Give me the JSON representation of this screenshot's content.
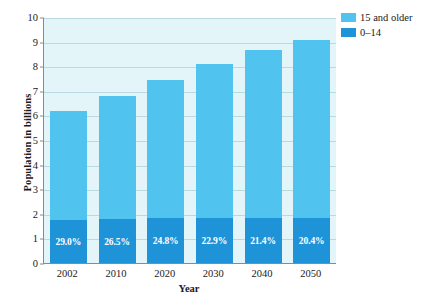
{
  "chart_data": {
    "type": "bar",
    "stacked": true,
    "title": "",
    "xlabel": "Year",
    "ylabel": "Population in billions",
    "categories": [
      "2002",
      "2010",
      "2020",
      "2030",
      "2040",
      "2050"
    ],
    "ylim": [
      0,
      10
    ],
    "yticks": [
      "0",
      "1",
      "2",
      "3",
      "4",
      "5",
      "6",
      "7",
      "8",
      "9",
      "10"
    ],
    "grid": true,
    "legend_position": "right-top",
    "series": [
      {
        "name": "15 and older",
        "color": "#51c3ef",
        "values": [
          4.4,
          5.03,
          5.64,
          6.28,
          6.84,
          7.24
        ]
      },
      {
        "name": "0–14",
        "color": "#1f93d7",
        "values": [
          1.8,
          1.82,
          1.86,
          1.87,
          1.86,
          1.86
        ]
      }
    ],
    "totals": [
      6.2,
      6.85,
      7.5,
      8.15,
      8.7,
      9.1
    ],
    "annotations": [
      "29.0%",
      "26.5%",
      "24.8%",
      "22.9%",
      "21.4%",
      "20.4%"
    ],
    "annotation_note": "Percent of total population aged 0–14"
  },
  "legend": {
    "items": [
      {
        "label": "15 and older",
        "color": "#51c3ef"
      },
      {
        "label": "0–14",
        "color": "#1f93d7"
      }
    ]
  },
  "colors": {
    "plot_background": "#e4f5f9",
    "gridline": "#b9d9e2",
    "axis": "#8a8a8a",
    "light_blue": "#51c3ef",
    "dark_blue": "#1f93d7",
    "label_text": "#ffffff",
    "page_background": "#ffffff"
  }
}
